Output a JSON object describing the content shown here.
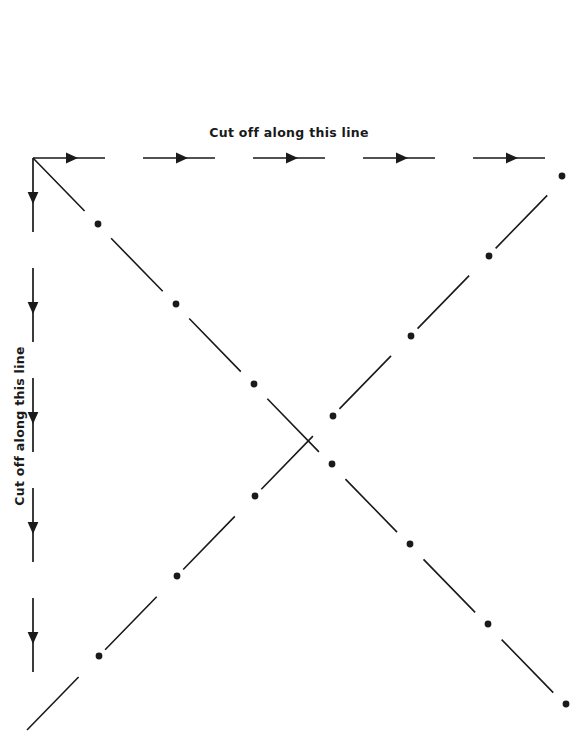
{
  "page": {
    "background_color": "#ffffff",
    "ink_color": "#1a1a1a",
    "width": 578,
    "height": 733
  },
  "labels": {
    "top": {
      "text": "Cut off along this line",
      "orientation": "horizontal",
      "x": 289,
      "y": 131
    },
    "left": {
      "text": "Cut off along this line",
      "orientation": "vertical-bottom-to-top",
      "x": 19,
      "y": 426
    }
  },
  "guides": {
    "top_cut_line": {
      "name": "top-cut-line",
      "style": "dashed-with-arrowheads",
      "direction": "right",
      "from": [
        33,
        158
      ],
      "to": [
        562,
        158
      ],
      "dash_count": 5,
      "dash_length": 72,
      "gap_length": 38,
      "stroke_width": 1.7
    },
    "left_cut_line": {
      "name": "left-cut-line",
      "style": "dashed-with-arrowheads",
      "direction": "down",
      "from": [
        33,
        158
      ],
      "to": [
        33,
        690
      ],
      "dash_count": 5,
      "dash_length": 74,
      "gap_length": 36,
      "stroke_width": 1.7
    },
    "fold_diagonal_nw_se": {
      "name": "fold-diagonal-nw-se",
      "style": "dash-dot",
      "from": [
        33,
        158
      ],
      "to": [
        570,
        710
      ],
      "dot_radius": 3.4,
      "stroke_width": 1.6
    },
    "fold_diagonal_sw_ne": {
      "name": "fold-diagonal-sw-ne",
      "style": "dash-dot",
      "from": [
        29,
        728
      ],
      "to": [
        565,
        174
      ],
      "dot_radius": 3.4,
      "stroke_width": 1.6
    }
  },
  "arrowheads": {
    "top": [
      {
        "x": 78,
        "y": 158
      },
      {
        "x": 188,
        "y": 158
      },
      {
        "x": 298,
        "y": 158
      },
      {
        "x": 408,
        "y": 158
      },
      {
        "x": 518,
        "y": 158
      }
    ],
    "left": [
      {
        "x": 33,
        "y": 204
      },
      {
        "x": 33,
        "y": 314
      },
      {
        "x": 33,
        "y": 424
      },
      {
        "x": 33,
        "y": 534
      },
      {
        "x": 33,
        "y": 644
      }
    ]
  },
  "dots": {
    "nw_se": [
      {
        "x": 98,
        "y": 224
      },
      {
        "x": 176,
        "y": 304
      },
      {
        "x": 254,
        "y": 384
      },
      {
        "x": 332,
        "y": 464
      },
      {
        "x": 410,
        "y": 544
      },
      {
        "x": 488,
        "y": 624
      },
      {
        "x": 566,
        "y": 704
      }
    ],
    "sw_ne": [
      {
        "x": 99,
        "y": 656
      },
      {
        "x": 177,
        "y": 576
      },
      {
        "x": 255,
        "y": 496
      },
      {
        "x": 333,
        "y": 416
      },
      {
        "x": 411,
        "y": 336
      },
      {
        "x": 489,
        "y": 256
      },
      {
        "x": 562,
        "y": 176
      }
    ]
  }
}
